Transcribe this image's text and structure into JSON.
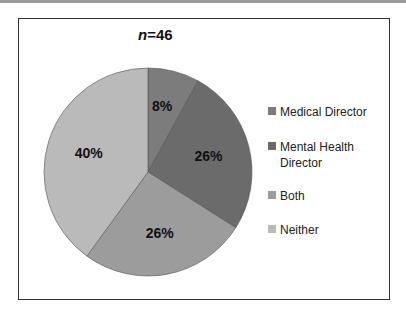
{
  "chart_data": {
    "type": "pie",
    "title": "n=46",
    "title_italic_part": "n",
    "title_rest": "=46",
    "categories": [
      "Medical Director",
      "Mental Health Director",
      "Both",
      "Neither"
    ],
    "values": [
      8,
      26,
      26,
      40
    ],
    "labels": [
      "8%",
      "26%",
      "26%",
      "40%"
    ],
    "colors": [
      "#7c7c7c",
      "#6b6b6b",
      "#9c9c9c",
      "#bababa"
    ],
    "legend_position": "right",
    "start_angle_deg": 0,
    "direction": "clockwise"
  }
}
